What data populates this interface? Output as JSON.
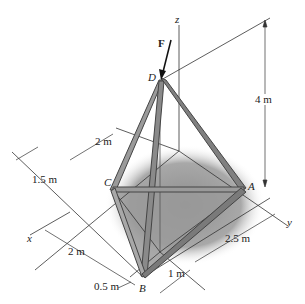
{
  "figure": {
    "force_label": "F",
    "axes": {
      "x": "x",
      "y": "y",
      "z": "z"
    },
    "points": {
      "A": "A",
      "B": "B",
      "C": "C",
      "D": "D"
    },
    "dimensions": {
      "height": "4 m",
      "d_top_2m": "2 m",
      "c_offset": "1.5 m",
      "x_2m": "2 m",
      "x_half": "0.5 m",
      "b_1m": "1 m",
      "y_2_5m": "2.5 m"
    },
    "colors": {
      "member": "#8a8a8a",
      "member_edge": "#444444",
      "shadow": "#9c9c9c",
      "line": "#333333"
    }
  }
}
